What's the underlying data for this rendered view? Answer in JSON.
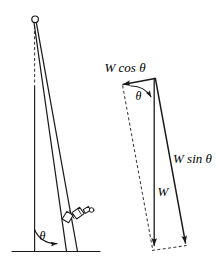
{
  "figure": {
    "background_color": "#ffffff",
    "ink_color": "#1a1a1a",
    "dashed_color": "#3a3a3a",
    "width": 220,
    "height": 265
  },
  "left_diagram": {
    "name": "leaning-pole-scene",
    "angle_label": "θ",
    "description_parts": {
      "vertical_reference": "vertical-dashed-and-solid-reference-line",
      "pole": "inclined-pole",
      "ground": "ground-line",
      "pivot_marker": "small-circle-at-pole-top",
      "attached_device": "clamp-device-on-pole"
    }
  },
  "right_diagram": {
    "name": "force-vector-decomposition",
    "angle_label": "θ",
    "vectors": [
      {
        "id": "w-cos-theta",
        "label": "W cos θ",
        "direction": "left-and-slightly-up",
        "style": "solid-arrow"
      },
      {
        "id": "w-sin-theta",
        "label": "W sin θ",
        "direction": "down-and-right-along-pole",
        "style": "solid-arrow"
      },
      {
        "id": "w",
        "label": "W",
        "direction": "straight-down",
        "style": "solid-arrow"
      }
    ],
    "construction_lines": [
      {
        "id": "dashed-resultant-left",
        "style": "dashed"
      },
      {
        "id": "dashed-base-closure",
        "style": "dashed"
      }
    ]
  }
}
